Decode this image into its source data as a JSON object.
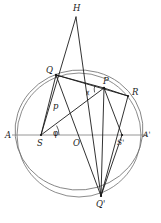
{
  "figure": {
    "background_color": "#ffffff",
    "stroke_color": "#1b1b1b",
    "curve_color": "#6e6e6e",
    "axis_color": "#8a8a8a",
    "width": 161,
    "height": 223
  },
  "points": [
    {
      "id": "H",
      "label": "H",
      "x": 76,
      "y": 17,
      "label_x": 73,
      "label_y": 11,
      "kind": "apex"
    },
    {
      "id": "Q",
      "label": "Q",
      "x": 56,
      "y": 75,
      "label_x": 48,
      "label_y": 72,
      "kind": "vertex"
    },
    {
      "id": "P",
      "label": "P",
      "x": 104,
      "y": 88,
      "label_x": 103,
      "label_y": 83,
      "kind": "vertex"
    },
    {
      "id": "R",
      "label": "R",
      "x": 128,
      "y": 96,
      "label_x": 133,
      "label_y": 94,
      "kind": "vertex"
    },
    {
      "id": "A",
      "label": "A",
      "x": 17,
      "y": 135,
      "label_x": 7,
      "label_y": 137,
      "kind": "axis-end"
    },
    {
      "id": "S",
      "label": "S",
      "x": 41,
      "y": 135,
      "label_x": 38,
      "label_y": 145,
      "kind": "focus"
    },
    {
      "id": "O",
      "label": "O",
      "x": 77,
      "y": 135,
      "label_x": 74,
      "label_y": 145,
      "kind": "center"
    },
    {
      "id": "S2",
      "label": "S'",
      "x": 122,
      "y": 135,
      "label_x": 118,
      "label_y": 145,
      "kind": "focus"
    },
    {
      "id": "A2",
      "label": "A'",
      "x": 142,
      "y": 135,
      "label_x": 144,
      "label_y": 137,
      "kind": "axis-end"
    },
    {
      "id": "Q2",
      "label": "Q'",
      "x": 101,
      "y": 196,
      "label_x": 98,
      "label_y": 206,
      "kind": "vertex"
    }
  ],
  "annotations": [
    {
      "id": "p",
      "label": "p",
      "x": 56,
      "y": 107,
      "style": "italic-latin"
    },
    {
      "id": "phi",
      "label": "φ",
      "x": 55,
      "y": 134,
      "style": "greek"
    },
    {
      "id": "chi",
      "label": "χ",
      "x": 88,
      "y": 93,
      "style": "greek-small"
    }
  ],
  "curves": [
    {
      "id": "circle",
      "type": "circle",
      "cx": 79,
      "cy": 135,
      "r": 62
    },
    {
      "id": "ellipse",
      "type": "ellipse",
      "cx": 79,
      "cy": 130,
      "rx": 64,
      "ry": 60,
      "rotation": -6
    }
  ],
  "segments": [
    {
      "id": "axis-AA",
      "from": "A",
      "to": "A2",
      "style": "axis"
    },
    {
      "id": "H-Q",
      "from": "H",
      "to": "S",
      "style": "line"
    },
    {
      "id": "H-P",
      "from": "H",
      "to": "Q2",
      "style": "line"
    },
    {
      "id": "Q-P",
      "from": "Q",
      "to": "P",
      "style": "line"
    },
    {
      "id": "Q-R",
      "from": "Q",
      "to": "R",
      "style": "line"
    },
    {
      "id": "Q-S",
      "from": "Q",
      "to": "S",
      "style": "line"
    },
    {
      "id": "Q-Q2",
      "from": "Q",
      "to": "Q2",
      "style": "line"
    },
    {
      "id": "S-P",
      "from": "S",
      "to": "P",
      "style": "line"
    },
    {
      "id": "P-R",
      "from": "P",
      "to": "R",
      "style": "line"
    },
    {
      "id": "P-S2",
      "from": "P",
      "to": "S2",
      "style": "line"
    },
    {
      "id": "P-Q2",
      "from": "P",
      "to": "Q2",
      "style": "line"
    },
    {
      "id": "R-Q2",
      "from": "R",
      "to": "Q2",
      "style": "line"
    },
    {
      "id": "S2-Q2",
      "from": "S2",
      "to": "Q2",
      "style": "line"
    }
  ]
}
